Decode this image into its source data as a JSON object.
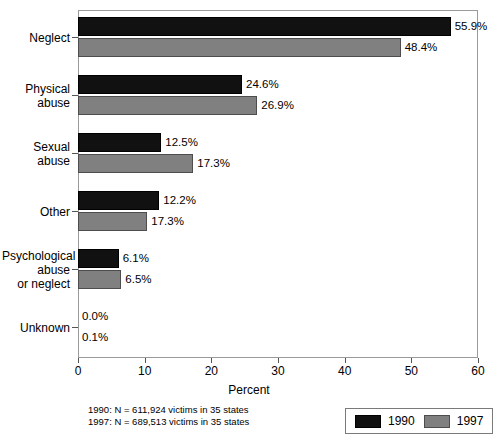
{
  "chart_data": {
    "type": "bar",
    "orientation": "horizontal",
    "title": "",
    "xlabel": "Percent",
    "ylabel": "",
    "xlim": [
      0,
      60
    ],
    "xticks": [
      0,
      10,
      20,
      30,
      40,
      50,
      60
    ],
    "grid": false,
    "legend_position": "bottom-right",
    "categories": [
      "Neglect",
      "Physical\nabuse",
      "Sexual\nabuse",
      "Other",
      "Psychological\nabuse\nor neglect",
      "Unknown"
    ],
    "series": [
      {
        "name": "1990",
        "color": "#111111",
        "values": [
          55.9,
          24.6,
          12.5,
          12.2,
          6.1,
          0.0
        ],
        "labels": [
          "55.9%",
          "24.6%",
          "12.5%",
          "12.2%",
          "6.1%",
          "0.0%"
        ],
        "drawn_values": [
          55.9,
          24.6,
          12.5,
          12.2,
          6.1,
          0.0
        ]
      },
      {
        "name": "1997",
        "color": "#808080",
        "values": [
          48.4,
          26.9,
          17.3,
          17.3,
          6.5,
          0.1
        ],
        "labels": [
          "48.4%",
          "26.9%",
          "17.3%",
          "17.3%",
          "6.5%",
          "0.1%"
        ],
        "drawn_values": [
          48.4,
          26.9,
          17.3,
          10.4,
          6.5,
          0.0
        ]
      }
    ]
  },
  "footnote": {
    "line1": "1990: N = 611,924 victims in 35 states",
    "line2": "1997: N = 689,513 victims in 35 states"
  },
  "legend": {
    "items": [
      {
        "label": "1990"
      },
      {
        "label": "1997"
      }
    ]
  },
  "axis": {
    "tick_labels": [
      "0",
      "10",
      "20",
      "30",
      "40",
      "50",
      "60"
    ],
    "title": "Percent"
  }
}
